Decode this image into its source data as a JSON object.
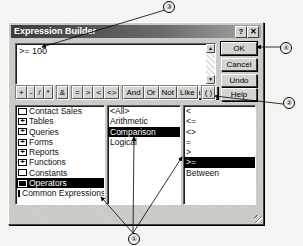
{
  "dialog": {
    "title": "Expression Builder",
    "help_glyph": "?",
    "close_glyph": "✕"
  },
  "expression": {
    "value": ">= 100",
    "scroll_up": "▲",
    "scroll_down": "▼"
  },
  "buttons": {
    "ok": "OK",
    "cancel": "Cancel",
    "undo": "Undo",
    "help": "Help",
    "paste": "Paste"
  },
  "operator_buttons": {
    "arithmetic": [
      "+",
      "-",
      "/",
      "*"
    ],
    "concat": [
      "&"
    ],
    "comparison": [
      "=",
      ">",
      "<",
      "<>"
    ],
    "logical": [
      "And",
      "Or",
      "Not",
      "Like"
    ],
    "parens": [
      "( )"
    ]
  },
  "lists": {
    "folders": [
      {
        "label": "Contact Sales",
        "icon": "folder-icon",
        "expandable": false,
        "selected": false
      },
      {
        "label": "Tables",
        "icon": "folder-plus-icon",
        "expandable": true,
        "selected": false
      },
      {
        "label": "Queries",
        "icon": "folder-plus-icon",
        "expandable": true,
        "selected": false
      },
      {
        "label": "Forms",
        "icon": "folder-plus-icon",
        "expandable": true,
        "selected": false
      },
      {
        "label": "Reports",
        "icon": "folder-plus-icon",
        "expandable": true,
        "selected": false
      },
      {
        "label": "Functions",
        "icon": "folder-plus-icon",
        "expandable": true,
        "selected": false
      },
      {
        "label": "Constants",
        "icon": "folder-icon",
        "expandable": false,
        "selected": false
      },
      {
        "label": "Operators",
        "icon": "folder-open-icon",
        "expandable": false,
        "selected": true
      },
      {
        "label": "Common Expressions",
        "icon": "folder-icon",
        "expandable": false,
        "selected": false
      }
    ],
    "categories": [
      {
        "label": "<All>",
        "selected": false
      },
      {
        "label": "Arithmetic",
        "selected": false
      },
      {
        "label": "Comparison",
        "selected": true
      },
      {
        "label": "Logical",
        "selected": false
      }
    ],
    "operators": [
      {
        "label": "<",
        "selected": false
      },
      {
        "label": "<=",
        "selected": false
      },
      {
        "label": "<>",
        "selected": false
      },
      {
        "label": "=",
        "selected": false
      },
      {
        "label": ">",
        "selected": false
      },
      {
        "label": ">=",
        "selected": true
      },
      {
        "label": "Between",
        "selected": false
      }
    ]
  },
  "callouts": {
    "c1": "①",
    "c2": "②",
    "c3": "③",
    "c4": "④"
  }
}
